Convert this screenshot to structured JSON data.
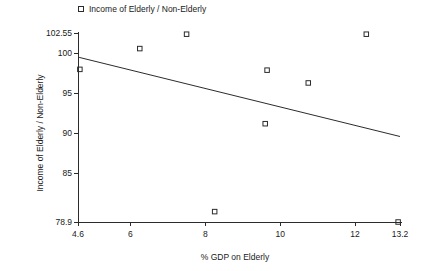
{
  "chart_data": {
    "type": "scatter",
    "title": "",
    "xlabel": "% GDP on Elderly",
    "ylabel": "Income of Elderly / Non-Elderly",
    "xlim": [
      4.6,
      13.2
    ],
    "ylim": [
      78.9,
      102.55
    ],
    "xticks": [
      "4.6",
      "6",
      "8",
      "10",
      "12",
      "13.2"
    ],
    "xtick_values": [
      4.6,
      6,
      8,
      10,
      12,
      13.2
    ],
    "yticks": [
      "78.9",
      "85",
      "90",
      "95",
      "100",
      "102.55"
    ],
    "ytick_values": [
      78.9,
      85,
      90,
      95,
      100,
      102.55
    ],
    "grid": false,
    "legend_position": "top-left",
    "legend": [
      {
        "label": "Income of Elderly / Non-Elderly",
        "marker": "open-square"
      }
    ],
    "series": [
      {
        "name": "Income of Elderly / Non-Elderly",
        "marker": "open-square",
        "color": "#2b2b2b",
        "points": [
          {
            "x": 4.65,
            "y": 98.0
          },
          {
            "x": 6.25,
            "y": 100.6
          },
          {
            "x": 7.5,
            "y": 102.4
          },
          {
            "x": 8.25,
            "y": 80.2
          },
          {
            "x": 9.6,
            "y": 91.2
          },
          {
            "x": 9.65,
            "y": 97.9
          },
          {
            "x": 10.75,
            "y": 96.3
          },
          {
            "x": 12.3,
            "y": 102.4
          },
          {
            "x": 13.15,
            "y": 78.9
          }
        ]
      }
    ],
    "trendline": {
      "type": "linear-fit",
      "x_start": 4.63,
      "y_start": 99.5,
      "x_end": 13.2,
      "y_end": 89.6,
      "color": "#2b2b2b"
    }
  },
  "colors": {
    "background": "#ffffff",
    "foreground": "#1a1a1a",
    "axis": "#2b2b2b",
    "marker": "#2b2b2b"
  }
}
